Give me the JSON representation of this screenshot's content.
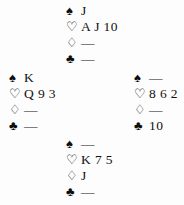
{
  "diagram": {
    "type": "bridge-hand-diagram",
    "void_symbol": "—",
    "suits": [
      {
        "key": "spades",
        "symbol": "♠",
        "name": "spade-icon",
        "fill": "filled"
      },
      {
        "key": "hearts",
        "symbol": "♡",
        "name": "heart-icon",
        "fill": "hollow"
      },
      {
        "key": "diamonds",
        "symbol": "♢",
        "name": "diamond-icon",
        "fill": "hollow"
      },
      {
        "key": "clubs",
        "symbol": "♣",
        "name": "club-icon",
        "fill": "filled"
      }
    ],
    "hands": {
      "north": {
        "position": "North",
        "spades": "J",
        "hearts": "A J 10",
        "diamonds": "—",
        "clubs": "—"
      },
      "west": {
        "position": "West",
        "spades": "K",
        "hearts": "Q 9 3",
        "diamonds": "—",
        "clubs": "—"
      },
      "east": {
        "position": "East",
        "spades": "—",
        "hearts": "8 6 2",
        "diamonds": "—",
        "clubs": "10"
      },
      "south": {
        "position": "South",
        "spades": "—",
        "hearts": "K 7 5",
        "diamonds": "J",
        "clubs": "—"
      }
    },
    "colors": {
      "ink": "#0d0d0d",
      "background": "#fdfdfd"
    }
  }
}
